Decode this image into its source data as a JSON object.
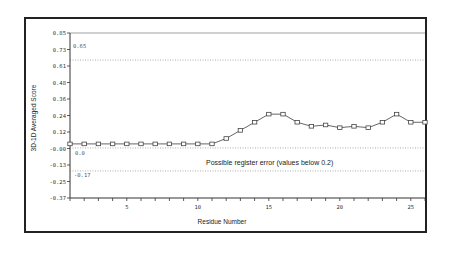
{
  "chart_data": {
    "type": "line",
    "title": "",
    "xlabel": "Residue Number",
    "ylabel": "3D-1D Averaged Score",
    "ylim": [
      -0.37,
      0.85
    ],
    "xlim": [
      1,
      26
    ],
    "y_ticks": [
      "0.85",
      "0.73",
      "0.61",
      "0.48",
      "0.36",
      "0.24",
      "0.12",
      "-0.00",
      "-0.13",
      "-0.25",
      "-0.37"
    ],
    "x_ticks": [
      "5",
      "10",
      "15",
      "20",
      "25"
    ],
    "grid": false,
    "legend": null,
    "series": [
      {
        "name": "3D-1D Averaged Score",
        "marker": "square",
        "x": [
          1,
          2,
          3,
          4,
          5,
          6,
          7,
          8,
          9,
          10,
          11,
          12,
          13,
          14,
          15,
          16,
          17,
          18,
          19,
          20,
          21,
          22,
          23,
          24,
          25,
          26
        ],
        "values": [
          0.03,
          0.03,
          0.03,
          0.03,
          0.03,
          0.03,
          0.03,
          0.03,
          0.03,
          0.03,
          0.03,
          0.07,
          0.13,
          0.19,
          0.25,
          0.25,
          0.19,
          0.16,
          0.17,
          0.15,
          0.16,
          0.15,
          0.19,
          0.25,
          0.19,
          0.19
        ]
      }
    ],
    "reference_lines": [
      {
        "value": 0.85,
        "style": "solid",
        "label": ""
      },
      {
        "value": 0.65,
        "style": "dotted",
        "label": "0.65"
      },
      {
        "value": 0.0,
        "style": "dotted",
        "label": "0.0"
      },
      {
        "value": -0.17,
        "style": "dotted",
        "label": "-0.17"
      }
    ],
    "annotations": [
      "Possible register error  (values below 0.2)"
    ]
  },
  "labels": {
    "xlabel": "Residue Number",
    "ylabel": "3D-1D Averaged Score",
    "annotation": "Possible register error  (values below 0.2)",
    "ref_065": "0.65",
    "ref_00": "0.0",
    "ref_017": "-0.17"
  }
}
